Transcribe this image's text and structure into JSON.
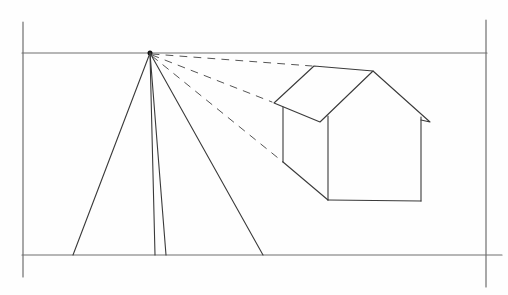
{
  "drawing": {
    "subject": "one-point perspective pencil sketch of a house with converging lines",
    "style": "pencil on paper",
    "colors": {
      "paper": "#fefefe",
      "pencil": "#3a3a3a",
      "frame": "#6e6e6e"
    },
    "vanishing_point": {
      "x": 150,
      "y": 53
    },
    "horizon_y": 53,
    "ground_y": 255,
    "frame": {
      "left_x": 23,
      "right_x": 486,
      "top_y": 53,
      "bottom_y": 255
    },
    "converging_lines_bottom_x": [
      73,
      155,
      166,
      263
    ],
    "house": {
      "roof_back_peak": {
        "x": 314,
        "y": 66
      },
      "roof_front_peak": {
        "x": 373,
        "y": 71
      },
      "left_eave": {
        "x": 274,
        "y": 103
      },
      "front_eave_corner": {
        "x": 320,
        "y": 122
      },
      "right_eave": {
        "x": 430,
        "y": 122
      },
      "left_wall_x": 283,
      "front_corner_x": 328,
      "right_wall_x": 421,
      "base_y": 201
    }
  }
}
